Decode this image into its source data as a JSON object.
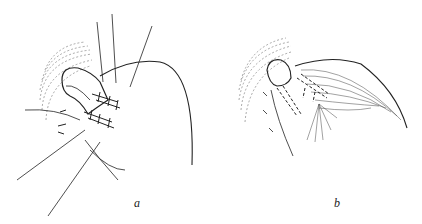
{
  "figure": {
    "panels": [
      {
        "id": "a",
        "label": "a",
        "description": "Suture placement with multiple threads over tubular structure"
      },
      {
        "id": "b",
        "label": "b",
        "description": "Completed fold over sutured structure with dashed suture lines"
      }
    ]
  },
  "colors": {
    "ink": "#222222",
    "background": "#ffffff"
  }
}
